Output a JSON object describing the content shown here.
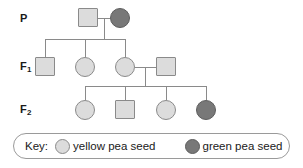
{
  "diagram": {
    "type": "pedigree-chart",
    "title": "",
    "generations": [
      {
        "id": "P",
        "label": "P",
        "label_sub": "",
        "individuals": [
          {
            "id": "P1",
            "shape": "square",
            "sex": "male",
            "phenotype": "yellow pea seed",
            "fill": "#dcdcdc"
          },
          {
            "id": "P2",
            "shape": "circle",
            "sex": "female",
            "phenotype": "green pea seed",
            "fill": "#787878"
          }
        ]
      },
      {
        "id": "F1",
        "label": "F",
        "label_sub": "1",
        "individuals": [
          {
            "id": "F1-1",
            "shape": "square",
            "sex": "male",
            "phenotype": "yellow pea seed",
            "fill": "#dcdcdc"
          },
          {
            "id": "F1-2",
            "shape": "circle",
            "sex": "female",
            "phenotype": "yellow pea seed",
            "fill": "#dcdcdc"
          },
          {
            "id": "F1-3",
            "shape": "circle",
            "sex": "female",
            "phenotype": "yellow pea seed",
            "fill": "#dcdcdc"
          },
          {
            "id": "F1-4",
            "shape": "square",
            "sex": "male",
            "phenotype": "yellow pea seed",
            "fill": "#dcdcdc"
          }
        ]
      },
      {
        "id": "F2",
        "label": "F",
        "label_sub": "2",
        "individuals": [
          {
            "id": "F2-1",
            "shape": "circle",
            "sex": "female",
            "phenotype": "yellow pea seed",
            "fill": "#dcdcdc"
          },
          {
            "id": "F2-2",
            "shape": "square",
            "sex": "male",
            "phenotype": "yellow pea seed",
            "fill": "#dcdcdc"
          },
          {
            "id": "F2-3",
            "shape": "circle",
            "sex": "female",
            "phenotype": "yellow pea seed",
            "fill": "#dcdcdc"
          },
          {
            "id": "F2-4",
            "shape": "circle",
            "sex": "female",
            "phenotype": "green pea seed",
            "fill": "#787878"
          }
        ]
      }
    ]
  },
  "key": {
    "label": "Key:",
    "entries": [
      {
        "swatch": "yellow-swatch",
        "text": "yellow pea seed",
        "color": "#dcdcdc"
      },
      {
        "swatch": "green-swatch",
        "text": "green pea seed",
        "color": "#787878"
      }
    ]
  },
  "colors": {
    "yellow_seed": "#dcdcdc",
    "green_seed": "#787878",
    "line": "#8a8a8a",
    "text": "#1a1a1a",
    "background": "#ffffff"
  }
}
